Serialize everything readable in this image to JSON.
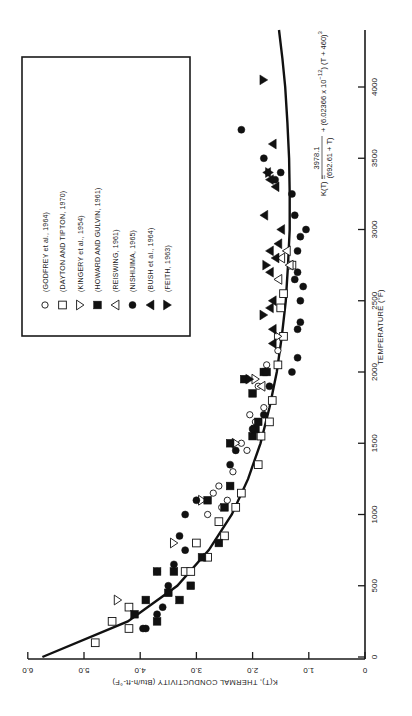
{
  "chart_data": {
    "type": "scatter",
    "orientation": "rotated 90 degrees counter-clockwise (x-axis vertical on right, y-axis horizontal along bottom)",
    "title": "",
    "xlabel": "TEMPERATURE (°F)",
    "ylabel": "K(T), THERMAL CONDUCTIVITY (Btu/h-ft-°F)",
    "xlim": [
      0,
      4400
    ],
    "ylim": [
      0,
      6.0
    ],
    "x_ticks": [
      0,
      500,
      1000,
      1500,
      2000,
      2500,
      3000,
      3500,
      4000
    ],
    "x_tick_labels": [
      "0",
      "500",
      "1000",
      "1500",
      "2000",
      "2500",
      "3000",
      "3500",
      "4000"
    ],
    "y_ticks": [
      0,
      1.0,
      2.0,
      3.0,
      4.0,
      5.0,
      6.0
    ],
    "y_tick_labels": [
      "0",
      "1.0",
      "2.0",
      "3.0",
      "4.0",
      "5.0",
      "6.0"
    ],
    "grid": false,
    "legend_position": "upper left (rotated view)",
    "fit_curve": {
      "name": "K(T) fit",
      "equation_parts": {
        "lhs": "K(T) =",
        "numerator": "3978.1",
        "denominator": "(692.61 + T)",
        "rest": "+ (6.02366 x 10",
        "exp": "−12",
        "tail": ") (T + 460)",
        "cube": "3"
      },
      "T": [
        0,
        250,
        500,
        750,
        1000,
        1250,
        1500,
        1750,
        2000,
        2250,
        2500,
        2750,
        3000,
        3250,
        3500,
        3750,
        4000,
        4200,
        4400
      ],
      "K": [
        5.74,
        4.22,
        3.34,
        2.78,
        2.37,
        2.08,
        1.86,
        1.7,
        1.57,
        1.48,
        1.41,
        1.37,
        1.34,
        1.34,
        1.35,
        1.38,
        1.42,
        1.47,
        1.53
      ]
    },
    "series": [
      {
        "name": "(GODFREY et al., 1964)",
        "marker": "open-circle",
        "points": [
          [
            1000,
            2.8
          ],
          [
            1050,
            2.55
          ],
          [
            1100,
            2.45
          ],
          [
            1150,
            2.7
          ],
          [
            1200,
            2.6
          ],
          [
            1300,
            2.35
          ],
          [
            1450,
            2.1
          ],
          [
            1500,
            2.2
          ],
          [
            1650,
            1.95
          ],
          [
            1700,
            2.05
          ],
          [
            1750,
            1.8
          ],
          [
            1900,
            1.9
          ],
          [
            2050,
            1.75
          ],
          [
            2150,
            1.55
          ]
        ]
      },
      {
        "name": "(DAYTON AND TIPTON, 1970)",
        "marker": "open-square",
        "points": [
          [
            100,
            4.8
          ],
          [
            250,
            4.5
          ],
          [
            200,
            4.2
          ],
          [
            350,
            4.2
          ],
          [
            600,
            3.2
          ],
          [
            600,
            3.1
          ],
          [
            800,
            3.0
          ],
          [
            700,
            2.8
          ],
          [
            950,
            2.6
          ],
          [
            850,
            2.5
          ],
          [
            1050,
            2.3
          ],
          [
            1150,
            2.2
          ],
          [
            1350,
            1.9
          ],
          [
            1550,
            1.85
          ],
          [
            1650,
            1.7
          ],
          [
            1800,
            1.65
          ],
          [
            2050,
            1.55
          ],
          [
            2250,
            1.45
          ],
          [
            2450,
            1.5
          ],
          [
            2550,
            1.45
          ],
          [
            2750,
            1.3
          ]
        ]
      },
      {
        "name": "(KINGERY et al., 1954)",
        "marker": "open-triangle-down",
        "points": [
          [
            400,
            4.4
          ],
          [
            800,
            3.4
          ],
          [
            1100,
            2.9
          ],
          [
            1500,
            2.3
          ],
          [
            1950,
            1.95
          ],
          [
            2250,
            1.55
          ]
        ]
      },
      {
        "name": "(HOWARD AND GULVIN, 1961)",
        "marker": "filled-square",
        "points": [
          [
            250,
            3.7
          ],
          [
            300,
            4.1
          ],
          [
            400,
            3.9
          ],
          [
            400,
            3.3
          ],
          [
            450,
            3.5
          ],
          [
            500,
            3.1
          ],
          [
            600,
            3.7
          ],
          [
            600,
            3.4
          ],
          [
            700,
            2.9
          ],
          [
            800,
            2.6
          ],
          [
            1100,
            2.8
          ],
          [
            1050,
            2.5
          ],
          [
            1200,
            2.4
          ],
          [
            1500,
            2.4
          ],
          [
            1550,
            2.0
          ],
          [
            1600,
            1.95
          ],
          [
            1650,
            1.9
          ],
          [
            1850,
            2.0
          ],
          [
            2000,
            1.8
          ],
          [
            2000,
            1.75
          ],
          [
            1950,
            2.15
          ]
        ]
      },
      {
        "name": "(REISWING, 1961)",
        "marker": "open-triangle-left",
        "points": [
          [
            1900,
            1.85
          ],
          [
            2650,
            1.55
          ],
          [
            2750,
            1.35
          ],
          [
            2800,
            1.5
          ],
          [
            2850,
            1.4
          ]
        ]
      },
      {
        "name": "(NISHIJIMA, 1965)",
        "marker": "filled-circle",
        "points": [
          [
            200,
            3.9
          ],
          [
            200,
            3.95
          ],
          [
            300,
            3.7
          ],
          [
            350,
            3.6
          ],
          [
            500,
            3.5
          ],
          [
            600,
            3.7
          ],
          [
            650,
            3.4
          ],
          [
            750,
            3.2
          ],
          [
            850,
            3.3
          ],
          [
            1000,
            3.2
          ],
          [
            1100,
            3.0
          ],
          [
            1350,
            2.4
          ],
          [
            1450,
            2.3
          ],
          [
            1600,
            2.0
          ],
          [
            1700,
            1.8
          ],
          [
            1900,
            1.7
          ],
          [
            2000,
            1.3
          ],
          [
            2100,
            1.2
          ],
          [
            2300,
            1.2
          ],
          [
            2350,
            1.15
          ],
          [
            2500,
            1.15
          ],
          [
            2600,
            1.1
          ],
          [
            2650,
            1.25
          ],
          [
            2700,
            1.2
          ],
          [
            2850,
            1.2
          ],
          [
            2950,
            1.15
          ],
          [
            3000,
            1.05
          ],
          [
            3100,
            1.25
          ],
          [
            3250,
            1.3
          ],
          [
            3350,
            1.6
          ],
          [
            3400,
            1.5
          ],
          [
            3500,
            1.8
          ],
          [
            3700,
            2.2
          ]
        ]
      },
      {
        "name": "(BUSH et al., 1964)",
        "marker": "filled-triangle-left",
        "points": [
          [
            2200,
            1.65
          ],
          [
            2300,
            1.65
          ],
          [
            2450,
            1.7
          ],
          [
            2500,
            1.65
          ],
          [
            2700,
            1.7
          ],
          [
            2800,
            1.6
          ],
          [
            2850,
            1.7
          ],
          [
            2900,
            1.55
          ],
          [
            3000,
            1.5
          ],
          [
            3100,
            1.8
          ],
          [
            3300,
            1.6
          ],
          [
            3350,
            1.7
          ],
          [
            3400,
            1.75
          ],
          [
            3600,
            1.65
          ]
        ]
      },
      {
        "name": "(FEITH, 1963)",
        "marker": "filled-triangle-right",
        "points": [
          [
            1950,
            2.05
          ],
          [
            2400,
            1.8
          ],
          [
            2750,
            1.75
          ],
          [
            3400,
            1.7
          ],
          [
            4050,
            1.8
          ]
        ]
      }
    ]
  },
  "legend": {
    "items": [
      {
        "label": "(GODFREY et al., 1964)",
        "marker": "open-circle"
      },
      {
        "label": "(DAYTON AND TIPTON, 1970)",
        "marker": "open-square"
      },
      {
        "label": "(KINGERY et al., 1954)",
        "marker": "open-triangle-down"
      },
      {
        "label": "(HOWARD AND GULVIN, 1961)",
        "marker": "filled-square"
      },
      {
        "label": "(REISWING, 1961)",
        "marker": "open-triangle-left"
      },
      {
        "label": "(NISHIJIMA, 1965)",
        "marker": "filled-circle"
      },
      {
        "label": "(BUSH et al., 1964)",
        "marker": "filled-triangle-left"
      },
      {
        "label": "(FEITH, 1963)",
        "marker": "filled-triangle-right"
      }
    ]
  },
  "colors": {
    "ink": "#1a1a1a",
    "background": "#ffffff"
  }
}
